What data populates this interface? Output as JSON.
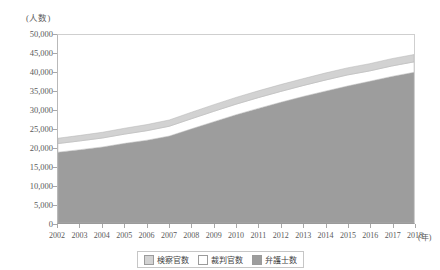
{
  "chart_data": {
    "type": "area",
    "title": "",
    "subtitle": "",
    "xlabel": "年",
    "ylabel": "人数",
    "y_unit_caption": "(人数)",
    "x_unit_caption": "(年)",
    "stacked": true,
    "grid": false,
    "legend_position": "bottom",
    "ylim": [
      0,
      50000
    ],
    "ytick_interval": 5000,
    "categories": [
      "2002",
      "2003",
      "2004",
      "2005",
      "2006",
      "2007",
      "2008",
      "2009",
      "2010",
      "2011",
      "2012",
      "2013",
      "2014",
      "2015",
      "2016",
      "2017",
      "2018"
    ],
    "x": [
      2002,
      2003,
      2004,
      2005,
      2006,
      2007,
      2008,
      2009,
      2010,
      2011,
      2012,
      2013,
      2014,
      2015,
      2016,
      2017,
      2018
    ],
    "ytick_labels": [
      "0",
      "5,000",
      "10,000",
      "15,000",
      "20,000",
      "25,000",
      "30,000",
      "35,000",
      "40,000",
      "45,000",
      "50,000"
    ],
    "ytick_values": [
      0,
      5000,
      10000,
      15000,
      20000,
      25000,
      30000,
      35000,
      40000,
      45000,
      50000
    ],
    "series": [
      {
        "name": "弁護士数",
        "color": "#9d9d9d",
        "stack_order": 1,
        "values": [
          18838,
          19508,
          20224,
          21185,
          22021,
          23119,
          25041,
          26930,
          28789,
          30485,
          32088,
          33624,
          35045,
          36415,
          37680,
          38980,
          40066
        ]
      },
      {
        "name": "裁判官数",
        "color": "#ffffff",
        "stack_order": 2,
        "values": [
          2288,
          2333,
          2385,
          2460,
          2535,
          2610,
          2685,
          2760,
          2805,
          2850,
          2880,
          2900,
          2944,
          2944,
          2755,
          2775,
          2782
        ]
      },
      {
        "name": "検察官数",
        "color": "#d2d2d2",
        "stack_order": 3,
        "values": [
          1419,
          1463,
          1521,
          1563,
          1627,
          1667,
          1739,
          1779,
          1806,
          1816,
          1839,
          1847,
          1877,
          1896,
          1930,
          1957,
          1957
        ]
      }
    ],
    "totals": [
      22545,
      23304,
      24130,
      25208,
      26183,
      27396,
      29465,
      31469,
      33400,
      35151,
      36807,
      38371,
      39866,
      41255,
      42365,
      43712,
      44805
    ]
  },
  "legend": {
    "items": [
      {
        "label": "検察官数",
        "color": "#d2d2d2"
      },
      {
        "label": "裁判官数",
        "color": "#ffffff"
      },
      {
        "label": "弁護士数",
        "color": "#9d9d9d"
      }
    ]
  },
  "colors": {
    "attorneys": "#9d9d9d",
    "judges": "#ffffff",
    "prosecutors": "#d2d2d2",
    "axis": "#9a9a9a",
    "text": "#5a5a5a",
    "frame": "#cfcfcf"
  }
}
